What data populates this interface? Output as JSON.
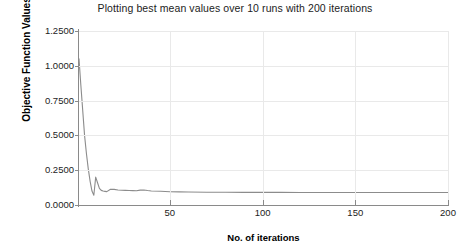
{
  "chart_data": {
    "type": "line",
    "title": "Plotting best mean values over 10 runs with 200 iterations",
    "xlabel": "No. of iterations",
    "ylabel": "Objective Function Values",
    "xlim": [
      1,
      200
    ],
    "ylim": [
      0.0,
      1.25
    ],
    "grid": true,
    "legend": null,
    "line_color": "#8c8c8c",
    "xticks": [
      50,
      100,
      150,
      200
    ],
    "xtick_labels": [
      "50",
      "100",
      "150",
      "200"
    ],
    "yticks": [
      0.0,
      0.25,
      0.5,
      0.75,
      1.0,
      1.25
    ],
    "ytick_labels": [
      "0.0000",
      "0.2500",
      "0.5000",
      "0.7500",
      "1.0000",
      "1.2500"
    ],
    "series": [
      {
        "name": "best mean value",
        "x": [
          1,
          2,
          3,
          4,
          5,
          6,
          7,
          8,
          9,
          10,
          11,
          12,
          13,
          14,
          15,
          16,
          18,
          20,
          22,
          24,
          26,
          28,
          30,
          32,
          34,
          36,
          38,
          40,
          45,
          50,
          55,
          60,
          70,
          80,
          90,
          100,
          110,
          120,
          130,
          140,
          150,
          160,
          170,
          180,
          190,
          200
        ],
        "values": [
          1.05,
          0.86,
          0.68,
          0.5,
          0.37,
          0.26,
          0.17,
          0.1,
          0.07,
          0.2,
          0.16,
          0.12,
          0.105,
          0.1,
          0.098,
          0.096,
          0.113,
          0.112,
          0.108,
          0.106,
          0.105,
          0.104,
          0.103,
          0.102,
          0.107,
          0.108,
          0.104,
          0.101,
          0.099,
          0.095,
          0.094,
          0.093,
          0.092,
          0.092,
          0.091,
          0.091,
          0.091,
          0.09,
          0.09,
          0.09,
          0.09,
          0.09,
          0.09,
          0.09,
          0.09,
          0.09
        ]
      }
    ]
  }
}
